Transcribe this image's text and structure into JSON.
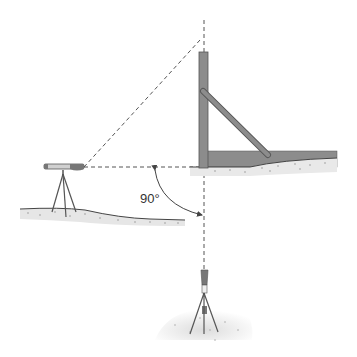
{
  "diagram": {
    "angle_label": "90°",
    "elements": {
      "instrument_left": "level-on-tripod",
      "instrument_bottom": "plumb-tripod",
      "post": "vertical-profile-post-with-brace",
      "ground": "soil-ground",
      "sight_lines": [
        "horizontal-dashed",
        "vertical-dashed",
        "diagonal-dashed"
      ]
    },
    "colors": {
      "post": "#8c8c8c",
      "ground": "#e6e6e6",
      "line": "#555555",
      "background": "#ffffff"
    }
  }
}
